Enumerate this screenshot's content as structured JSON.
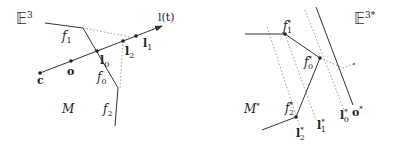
{
  "left_panel": {
    "space_label": "𝔼",
    "space_sup": "3",
    "manifold_label": "M",
    "faces": [
      {
        "name": "f",
        "sub": "1"
      },
      {
        "name": "f",
        "sub": "0"
      },
      {
        "name": "f",
        "sub": "2"
      }
    ],
    "points": [
      {
        "label": "c"
      },
      {
        "label": "o"
      },
      {
        "label": "l",
        "sub": "0"
      },
      {
        "label": "l",
        "sub": "2"
      },
      {
        "label": "l",
        "sub": "1"
      }
    ],
    "ray_label": "l(t)"
  },
  "right_panel": {
    "space_label": "𝔼",
    "space_sup": "3*",
    "manifold_label": "M",
    "manifold_sup": "*",
    "vertices": [
      {
        "name": "f",
        "sub": "1",
        "sup": "*"
      },
      {
        "name": "f",
        "sub": "0",
        "sup": "*"
      },
      {
        "name": "f",
        "sub": "2",
        "sup": "*"
      }
    ],
    "planes": [
      {
        "name": "l",
        "sub": "2",
        "sup": "*"
      },
      {
        "name": "l",
        "sub": "1",
        "sup": "*"
      },
      {
        "name": "l",
        "sub": "0",
        "sup": "*"
      }
    ],
    "origin_label": "o",
    "origin_sup": "*"
  }
}
